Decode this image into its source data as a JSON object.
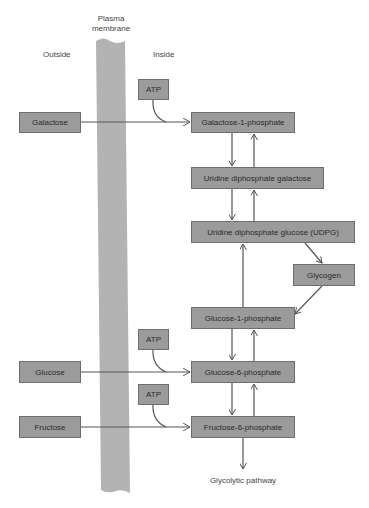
{
  "labels": {
    "membrane": "Plasma\nmembrane",
    "membrane_line1": "Plasma",
    "membrane_line2": "membrane",
    "outside": "Outside",
    "inside": "Inside",
    "glycolytic": "Glycolytic pathway"
  },
  "outside_sugars": [
    "Galactose",
    "Glucose",
    "Fructose"
  ],
  "atp": [
    "ATP",
    "ATP",
    "ATP"
  ],
  "inside_nodes": {
    "gal1p": "Galactose-1-phosphate",
    "udpgal": "Uridine diphosphate galactose",
    "udpg": "Uridine diphosphate glucose (UDPG)",
    "glycogen": "Glycogen",
    "glc1p": "Glucose-1-phosphate",
    "glc6p": "Glucose-6-phosphate",
    "fru6p": "Fructose-6-phosphate"
  },
  "colors": {
    "box_fill": "#9b9b9b",
    "box_border": "#6e6e6e",
    "membrane": "#b3b3b3",
    "arrow": "#555555"
  }
}
